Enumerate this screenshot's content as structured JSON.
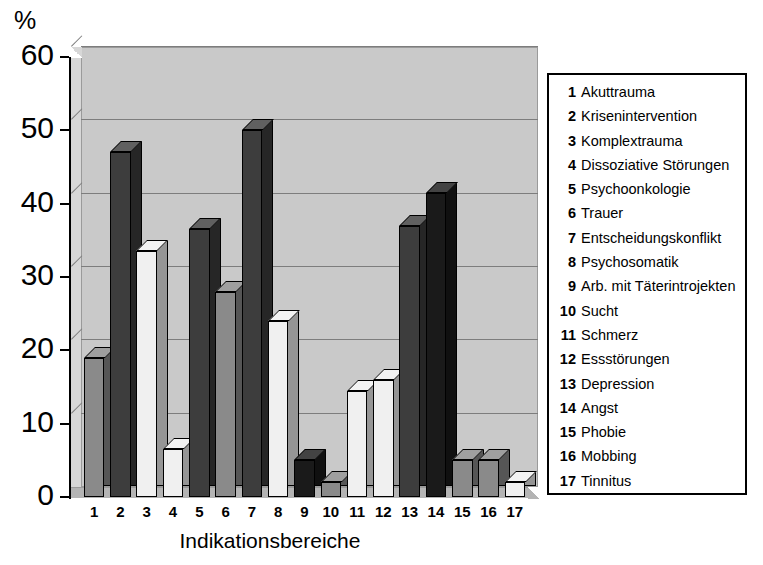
{
  "chart_data": {
    "type": "bar",
    "title": "",
    "xlabel": "Indikationsbereiche",
    "ylabel": "%",
    "ylim": [
      0,
      60
    ],
    "yticks": [
      0,
      10,
      20,
      30,
      40,
      50,
      60
    ],
    "grid": true,
    "legend_position": "right",
    "categories": [
      "1",
      "2",
      "3",
      "4",
      "5",
      "6",
      "7",
      "8",
      "9",
      "10",
      "11",
      "12",
      "13",
      "14",
      "15",
      "16",
      "17"
    ],
    "values": [
      19,
      47,
      33.5,
      6.5,
      36.5,
      28,
      50,
      24,
      5,
      2,
      14.5,
      16,
      37,
      41.5,
      5,
      5,
      2
    ],
    "bar_shades": [
      "medium",
      "dark",
      "light",
      "light",
      "dark",
      "medium",
      "dark",
      "light",
      "darkest",
      "medium",
      "light",
      "light",
      "dark",
      "darkest",
      "medium",
      "medium",
      "light"
    ],
    "category_names": [
      "Akuttrauma",
      "Krisenintervention",
      "Komplextrauma",
      "Dissoziative Störungen",
      "Psychoonkologie",
      "Trauer",
      "Entscheidungskonflikt",
      "Psychosomatik",
      "Arb. mit Täterintrojekten",
      "Sucht",
      "Schmerz",
      "Essstörungen",
      "Depression",
      "Angst",
      "Phobie",
      "Mobbing",
      "Tinnitus"
    ]
  },
  "axis": {
    "unit_label": "%",
    "tick_labels": [
      "60",
      "50",
      "40",
      "30",
      "20",
      "10",
      "0"
    ],
    "title": "Indikationsbereiche",
    "category_labels": [
      "1",
      "2",
      "3",
      "4",
      "5",
      "6",
      "7",
      "8",
      "9",
      "10",
      "11",
      "12",
      "13",
      "14",
      "15",
      "16",
      "17"
    ]
  },
  "legend": {
    "items": [
      {
        "num": "1",
        "label": "Akuttrauma"
      },
      {
        "num": "2",
        "label": "Krisenintervention"
      },
      {
        "num": "3",
        "label": "Komplextrauma"
      },
      {
        "num": "4",
        "label": "Dissoziative Störungen"
      },
      {
        "num": "5",
        "label": "Psychoonkologie"
      },
      {
        "num": "6",
        "label": "Trauer"
      },
      {
        "num": "7",
        "label": "Entscheidungskonflikt"
      },
      {
        "num": "8",
        "label": "Psychosomatik"
      },
      {
        "num": "9",
        "label": "Arb. mit Täterintrojekten"
      },
      {
        "num": "10",
        "label": "Sucht"
      },
      {
        "num": "11",
        "label": "Schmerz"
      },
      {
        "num": "12",
        "label": "Essstörungen"
      },
      {
        "num": "13",
        "label": "Depression"
      },
      {
        "num": "14",
        "label": "Angst"
      },
      {
        "num": "15",
        "label": "Phobie"
      },
      {
        "num": "16",
        "label": "Mobbing"
      },
      {
        "num": "17",
        "label": "Tinnitus"
      }
    ]
  },
  "colors": {
    "plot_background": "#c9c9c9",
    "left_wall": "#d7d7d7",
    "floor": "#b4b4b4",
    "gridline": "#7d7d7d",
    "bar_light": "#f0f0f0",
    "bar_medium": "#8a8a8a",
    "bar_dark": "#3d3d3d",
    "bar_darkest": "#1a1a1a",
    "text": "#000000"
  }
}
